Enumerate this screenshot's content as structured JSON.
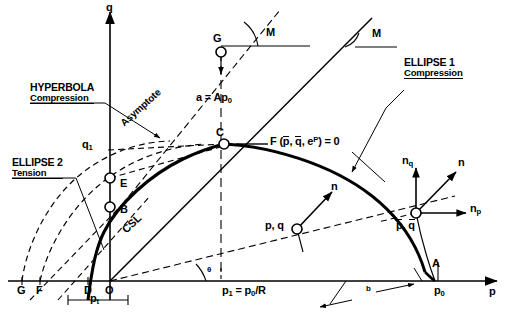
{
  "figure": {
    "type": "critical-state-yield-surface-diagram",
    "axes": {
      "x_label": "p",
      "y_label": "q"
    },
    "annotations": {
      "hyperbola_title": "HYPERBOLA",
      "hyperbola_sub": "Compression",
      "ellipse2_title": "ELLIPSE 2",
      "ellipse2_sub": "Tension",
      "ellipse1_title": "ELLIPSE 1",
      "ellipse1_sub": "Compression",
      "asymptote": "Asymptote",
      "csl": "CSL",
      "a_equals": "a = Ap",
      "a_equals_sub": "0",
      "yield_fn_F": "F (",
      "yield_fn_p": "p",
      "yield_fn_comma1": ", ",
      "yield_fn_q": "q",
      "yield_fn_comma2": ", e",
      "yield_fn_sup": "P",
      "yield_fn_tail": ") = 0",
      "theta": "θ",
      "p1_eq": "p",
      "p1_eq_sub": "1",
      "p1_eq_rhs": " = p",
      "p1_eq_rhs_sub": "0",
      "p1_eq_rhs_tail": "/R",
      "pt_dim": "p",
      "pt_dim_sub": "t",
      "b_dim": "b"
    },
    "points": [
      {
        "name": "G_top",
        "label": "G"
      },
      {
        "name": "C",
        "label": "C"
      },
      {
        "name": "E",
        "label": "E"
      },
      {
        "name": "B",
        "label": "B"
      },
      {
        "name": "G_axis",
        "label": "G"
      },
      {
        "name": "F_axis",
        "label": "F"
      },
      {
        "name": "D_axis",
        "label": "D"
      },
      {
        "name": "O_origin",
        "label": "O"
      },
      {
        "name": "A_axis",
        "label": "A"
      },
      {
        "name": "p0_axis",
        "label": "p",
        "sub": "0"
      },
      {
        "name": "q1_axis",
        "label": "q",
        "sub": "1"
      },
      {
        "name": "pq_lower",
        "label": "p, q"
      },
      {
        "name": "pq_bar",
        "label_p": "p",
        "label_q": "q"
      }
    ],
    "slope_labels": [
      {
        "name": "M_left",
        "label": "M"
      },
      {
        "name": "M_right",
        "label": "M"
      }
    ],
    "normals": [
      {
        "name": "n_q",
        "label": "n",
        "sub": "q"
      },
      {
        "name": "n_p",
        "label": "n",
        "sub": "p"
      },
      {
        "name": "n_main",
        "label": "n"
      },
      {
        "name": "n_mid",
        "label": "n"
      }
    ],
    "colors": {
      "stroke": "#000000",
      "background": "#ffffff"
    }
  }
}
